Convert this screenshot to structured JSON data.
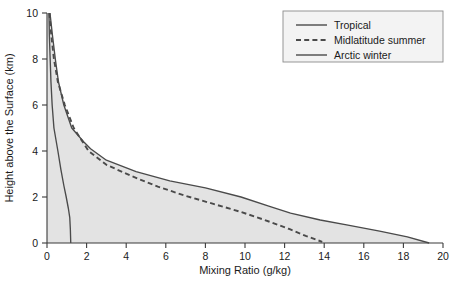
{
  "chart_data": {
    "type": "line",
    "title": "",
    "xlabel": "Mixing Ratio (g/kg)",
    "ylabel": "Height above the Surface (km)",
    "xlim": [
      0,
      20
    ],
    "ylim": [
      0,
      10
    ],
    "xticks": [
      0,
      2,
      4,
      6,
      8,
      10,
      12,
      14,
      16,
      18,
      20
    ],
    "yticks": [
      0,
      2,
      4,
      6,
      8,
      10
    ],
    "grid": false,
    "legend_position": "top-right",
    "series": [
      {
        "name": "Tropical",
        "style": "solid",
        "color": "#4a4a4a",
        "points": [
          [
            0.15,
            10.0
          ],
          [
            0.28,
            9.0
          ],
          [
            0.42,
            8.0
          ],
          [
            0.58,
            7.0
          ],
          [
            0.85,
            6.0
          ],
          [
            1.25,
            5.0
          ],
          [
            1.85,
            4.4
          ],
          [
            2.2,
            4.1
          ],
          [
            3.0,
            3.6
          ],
          [
            4.5,
            3.1
          ],
          [
            6.2,
            2.7
          ],
          [
            8.0,
            2.4
          ],
          [
            9.8,
            2.0
          ],
          [
            11.2,
            1.6
          ],
          [
            12.3,
            1.3
          ],
          [
            13.8,
            1.0
          ],
          [
            15.2,
            0.78
          ],
          [
            16.8,
            0.52
          ],
          [
            18.2,
            0.27
          ],
          [
            19.3,
            0.0
          ]
        ]
      },
      {
        "name": "Midlatitude summer",
        "style": "dashed",
        "color": "#3a3a3a",
        "points": [
          [
            0.12,
            10.0
          ],
          [
            0.22,
            9.0
          ],
          [
            0.35,
            8.0
          ],
          [
            0.55,
            7.0
          ],
          [
            0.9,
            6.0
          ],
          [
            1.35,
            5.0
          ],
          [
            2.1,
            4.0
          ],
          [
            3.0,
            3.4
          ],
          [
            4.3,
            2.9
          ],
          [
            5.6,
            2.45
          ],
          [
            7.0,
            2.05
          ],
          [
            8.4,
            1.7
          ],
          [
            9.8,
            1.35
          ],
          [
            11.0,
            1.0
          ],
          [
            12.2,
            0.62
          ],
          [
            13.1,
            0.3
          ],
          [
            13.9,
            0.05
          ]
        ]
      },
      {
        "name": "Arctic winter",
        "style": "solid",
        "color": "#4a4a4a",
        "points": [
          [
            0.1,
            10.0
          ],
          [
            0.12,
            9.0
          ],
          [
            0.16,
            8.0
          ],
          [
            0.2,
            7.0
          ],
          [
            0.26,
            6.0
          ],
          [
            0.35,
            5.0
          ],
          [
            0.55,
            4.0
          ],
          [
            0.7,
            3.2
          ],
          [
            0.85,
            2.5
          ],
          [
            0.97,
            2.0
          ],
          [
            1.08,
            1.5
          ],
          [
            1.15,
            1.1
          ],
          [
            1.18,
            0.6
          ],
          [
            1.2,
            0.0
          ]
        ]
      }
    ]
  },
  "legend": {
    "items": [
      {
        "label": "Tropical",
        "style": "solid"
      },
      {
        "label": "Midlatitude summer",
        "style": "dashed"
      },
      {
        "label": "Arctic winter",
        "style": "solid"
      }
    ]
  },
  "colors": {
    "plot_shade": "#e3e3e3",
    "axis": "#3b3b3b",
    "line": "#4a4a4a",
    "page_background": "#ffffff",
    "legend_background": "#f3f3f3"
  }
}
